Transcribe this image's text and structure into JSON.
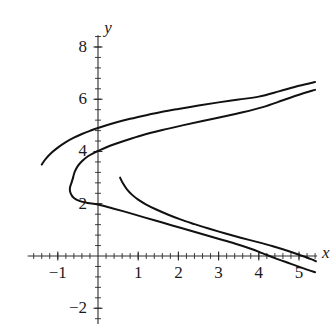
{
  "chart_data": {
    "type": "line",
    "title": "",
    "subtitle": "",
    "xlabel": "x",
    "ylabel": "y",
    "xlim": [
      -1.75,
      5.45
    ],
    "ylim": [
      -2.6,
      8.45
    ],
    "grid": false,
    "legend": "none",
    "background_color": "#ffffff",
    "curve_color": "#111111",
    "axis_color": "#2b2b2b",
    "x_ticks_major": [
      -1,
      1,
      2,
      3,
      4,
      5
    ],
    "x_tick_labels": [
      "−1",
      "1",
      "2",
      "3",
      "4",
      "5"
    ],
    "x_ticks_minor_step": 0.2,
    "y_ticks_major": [
      -2,
      2,
      4,
      6,
      8
    ],
    "y_tick_labels": [
      "−2",
      "2",
      "4",
      "6",
      "8"
    ],
    "y_ticks_minor_step": 0.4,
    "x_axis_label_text": "x",
    "y_axis_label_text": "y",
    "series": [
      {
        "name": "curve-1-upper-branch",
        "comment": "Upper arc starting at left (-1.40, 3.50) rising to the right edge (5.40, 6.65)",
        "points": [
          [
            -1.4,
            3.5
          ],
          [
            -1.3,
            3.72
          ],
          [
            -1.15,
            3.96
          ],
          [
            -1.0,
            4.15
          ],
          [
            -0.8,
            4.36
          ],
          [
            -0.6,
            4.53
          ],
          [
            -0.4,
            4.67
          ],
          [
            -0.2,
            4.79
          ],
          [
            0.0,
            4.9
          ],
          [
            0.4,
            5.09
          ],
          [
            0.8,
            5.25
          ],
          [
            1.2,
            5.39
          ],
          [
            1.6,
            5.52
          ],
          [
            2.0,
            5.63
          ],
          [
            2.5,
            5.76
          ],
          [
            3.0,
            5.88
          ],
          [
            3.5,
            5.99
          ],
          [
            4.0,
            6.1
          ],
          [
            4.5,
            6.3
          ],
          [
            5.0,
            6.52
          ],
          [
            5.4,
            6.66
          ]
        ]
      },
      {
        "name": "curve-2-upper-branch",
        "comment": "Second sideways parabola, upper branch from vertex (-0.62, 3.00) to right edge (5.40, 6.35)",
        "points": [
          [
            -0.62,
            3.0
          ],
          [
            -0.58,
            3.22
          ],
          [
            -0.5,
            3.45
          ],
          [
            -0.4,
            3.63
          ],
          [
            -0.25,
            3.82
          ],
          [
            -0.1,
            3.95
          ],
          [
            0.0,
            4.02
          ],
          [
            0.3,
            4.22
          ],
          [
            0.7,
            4.43
          ],
          [
            1.1,
            4.62
          ],
          [
            1.6,
            4.82
          ],
          [
            2.1,
            5.0
          ],
          [
            2.6,
            5.17
          ],
          [
            3.1,
            5.33
          ],
          [
            3.6,
            5.5
          ],
          [
            4.1,
            5.7
          ],
          [
            4.6,
            5.96
          ],
          [
            5.0,
            6.17
          ],
          [
            5.4,
            6.36
          ]
        ]
      },
      {
        "name": "curve-2-lower-branch",
        "comment": "Second sideways parabola, lower branch from vertex (-0.62, 3.00) descending through (0,2.0) and crossing the x-axis near x = 4.05",
        "points": [
          [
            -0.62,
            3.0
          ],
          [
            -0.66,
            2.8
          ],
          [
            -0.7,
            2.6
          ],
          [
            -0.68,
            2.4
          ],
          [
            -0.6,
            2.22
          ],
          [
            -0.45,
            2.1
          ],
          [
            -0.25,
            2.03
          ],
          [
            0.0,
            1.97
          ],
          [
            0.35,
            1.83
          ],
          [
            0.75,
            1.66
          ],
          [
            1.15,
            1.48
          ],
          [
            1.6,
            1.28
          ],
          [
            2.05,
            1.08
          ],
          [
            2.5,
            0.88
          ],
          [
            2.95,
            0.68
          ],
          [
            3.4,
            0.48
          ],
          [
            3.8,
            0.28
          ],
          [
            4.1,
            0.1
          ],
          [
            4.4,
            -0.08
          ],
          [
            4.8,
            -0.3
          ],
          [
            5.2,
            -0.52
          ],
          [
            5.4,
            -0.62
          ]
        ]
      },
      {
        "name": "curve-3-arc",
        "comment": "Shorter arc beginning at (0.55, 3.00) sweeping right and down, crossing the x-axis near x = 4.95",
        "points": [
          [
            0.55,
            3.0
          ],
          [
            0.62,
            2.78
          ],
          [
            0.72,
            2.55
          ],
          [
            0.85,
            2.34
          ],
          [
            1.0,
            2.16
          ],
          [
            1.2,
            1.97
          ],
          [
            1.45,
            1.78
          ],
          [
            1.75,
            1.58
          ],
          [
            2.05,
            1.4
          ],
          [
            2.4,
            1.22
          ],
          [
            2.75,
            1.05
          ],
          [
            3.15,
            0.87
          ],
          [
            3.55,
            0.7
          ],
          [
            3.95,
            0.54
          ],
          [
            4.35,
            0.37
          ],
          [
            4.75,
            0.18
          ],
          [
            5.05,
            0.02
          ],
          [
            5.3,
            -0.12
          ],
          [
            5.42,
            -0.2
          ]
        ]
      }
    ]
  }
}
